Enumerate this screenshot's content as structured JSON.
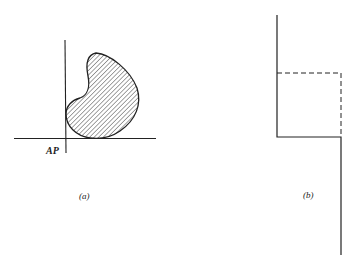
{
  "figure_a": {
    "axis_label": "AP",
    "caption": "(a)",
    "description": "Hatched kidney-shaped region tangent to horizontal axis, touching vertical axis"
  },
  "figure_b": {
    "caption": "(b)",
    "description": "Step-shaped solid line with dashed square completing a rectangle"
  },
  "colors": {
    "line": "#222222",
    "background": "#ffffff"
  }
}
